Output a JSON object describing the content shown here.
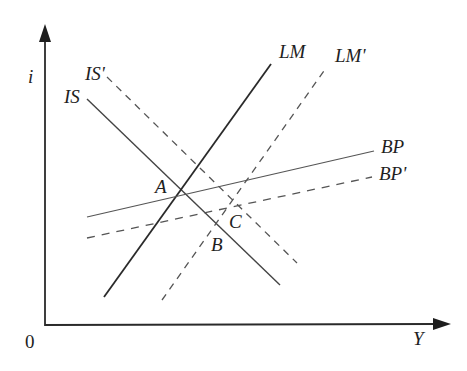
{
  "diagram": {
    "type": "IS-LM-BP diagram",
    "axes": {
      "y_label": "i",
      "x_label": "Y",
      "origin_label": "0"
    },
    "curves": [
      {
        "id": "is",
        "label": "IS",
        "style": "solid"
      },
      {
        "id": "is_prime",
        "label": "IS'",
        "style": "dashed"
      },
      {
        "id": "lm",
        "label": "LM",
        "style": "solid"
      },
      {
        "id": "lm_prime",
        "label": "LM'",
        "style": "dashed"
      },
      {
        "id": "bp",
        "label": "BP",
        "style": "solid"
      },
      {
        "id": "bp_prime",
        "label": "BP'",
        "style": "dashed"
      }
    ],
    "points": [
      {
        "id": "a",
        "label": "A",
        "description": "Intersection of IS, LM and BP"
      },
      {
        "id": "b",
        "label": "B",
        "description": "Intersection of IS and LM'"
      },
      {
        "id": "c",
        "label": "C",
        "description": "Intersection of IS', LM' and BP'"
      }
    ],
    "colors": {
      "line": "#2a2a2a",
      "thin_line": "#555555",
      "dashed": "#555555"
    }
  }
}
